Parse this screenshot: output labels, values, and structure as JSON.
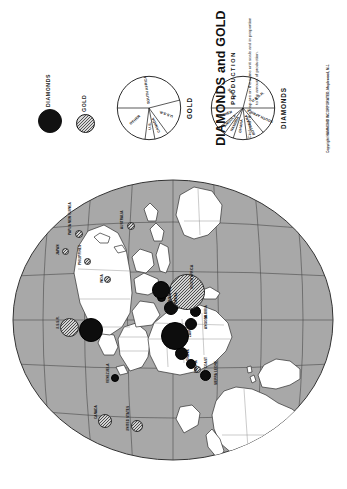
{
  "title": "DIAMONDS and  GOLD",
  "subtitle": "PRODUCTION",
  "caption": "Circles on the map are on the same unit scale and in proportion to the amount of production.",
  "copyright": "Copyright HAMMOND INCORPORATED, Maplewood, N.J.",
  "legend": {
    "diamonds_label": "DIAMONDS",
    "gold_label": "GOLD",
    "diamond_color": "#0d0d0d",
    "gold_color": "#d2d2d2"
  },
  "pies": [
    {
      "name": "GOLD",
      "caption": "GOLD",
      "slices": [
        {
          "label": "SOUTH AFRICA",
          "pct": 46
        },
        {
          "label": "U.S.S.R.",
          "pct": 19
        },
        {
          "label": "CANADA",
          "pct": 7
        },
        {
          "label": "U.S.",
          "pct": 5
        },
        {
          "label": "OTHER",
          "pct": 23
        }
      ]
    },
    {
      "name": "DIAMONDS",
      "caption": "DIAMONDS",
      "slices": [
        {
          "label": "ZAIRE",
          "pct": 29
        },
        {
          "label": "U.S.S.R.",
          "pct": 21
        },
        {
          "label": "SOUTH AFRICA",
          "pct": 14
        },
        {
          "label": "BOTSWANA",
          "pct": 9
        },
        {
          "label": "GHANA",
          "pct": 7
        },
        {
          "label": "NAMIBIA",
          "pct": 5
        },
        {
          "label": "ANGOLA",
          "pct": 4
        },
        {
          "label": "OTHER",
          "pct": 11
        }
      ]
    }
  ],
  "chart_data": {
    "type": "pie",
    "title": "DIAMONDS and GOLD PRODUCTION",
    "charts": [
      {
        "title": "GOLD",
        "categories": [
          "SOUTH AFRICA",
          "U.S.S.R.",
          "CANADA",
          "U.S.",
          "OTHER"
        ],
        "values": [
          46,
          19,
          7,
          5,
          23
        ],
        "units": "percent of world production"
      },
      {
        "title": "DIAMONDS",
        "categories": [
          "ZAIRE",
          "U.S.S.R.",
          "SOUTH AFRICA",
          "BOTSWANA",
          "GHANA",
          "NAMIBIA",
          "ANGOLA",
          "OTHER"
        ],
        "values": [
          29,
          21,
          14,
          9,
          7,
          5,
          4,
          11
        ],
        "units": "percent of world production"
      }
    ],
    "map_symbols": {
      "type": "proportional-circle",
      "legend": [
        "DIAMONDS",
        "GOLD"
      ]
    }
  },
  "map": {
    "labels": [
      {
        "text": "CANADA",
        "x": 60,
        "y": 86,
        "rot": 0
      },
      {
        "text": "UNITED STATES",
        "x": 48,
        "y": 118,
        "rot": 0
      },
      {
        "text": "VENEZUELA",
        "x": 96,
        "y": 98,
        "rot": 0
      },
      {
        "text": "U.S.S.R.",
        "x": 150,
        "y": 48,
        "rot": 0
      },
      {
        "text": "GHANA",
        "x": 118,
        "y": 178,
        "rot": 0
      },
      {
        "text": "LIBERIA",
        "x": 106,
        "y": 186,
        "rot": 0
      },
      {
        "text": "IVORY COAST",
        "x": 100,
        "y": 196,
        "rot": 0
      },
      {
        "text": "SIERRA LEONE",
        "x": 94,
        "y": 206,
        "rot": 0
      },
      {
        "text": "ZAIRE",
        "x": 142,
        "y": 180,
        "rot": 0
      },
      {
        "text": "ANGOLA",
        "x": 150,
        "y": 196,
        "rot": 0
      },
      {
        "text": "NAMIBIA",
        "x": 160,
        "y": 196,
        "rot": 0
      },
      {
        "text": "BOTSWANA",
        "x": 168,
        "y": 166,
        "rot": 0
      },
      {
        "text": "TANZANIA",
        "x": 176,
        "y": 160,
        "rot": 0
      },
      {
        "text": "SOUTH AFRICA",
        "x": 190,
        "y": 182,
        "rot": 0
      },
      {
        "text": "INDIA",
        "x": 196,
        "y": 92,
        "rot": 0
      },
      {
        "text": "PHILIPPINES",
        "x": 214,
        "y": 70,
        "rot": 0
      },
      {
        "text": "JAPAN",
        "x": 224,
        "y": 48,
        "rot": 0
      },
      {
        "text": "PAPUA NEW GUINEA",
        "x": 244,
        "y": 60,
        "rot": 0
      },
      {
        "text": "AUSTRALIA",
        "x": 250,
        "y": 112,
        "rot": 0
      }
    ],
    "circles": [
      {
        "place": "CANADA",
        "kind": "gold",
        "x": 57,
        "y": 96,
        "d": 12
      },
      {
        "place": "UNITED STATES",
        "kind": "gold",
        "x": 52,
        "y": 128,
        "d": 10
      },
      {
        "place": "VENEZUELA",
        "kind": "diamond",
        "x": 100,
        "y": 106,
        "d": 6
      },
      {
        "place": "U.S.S.R. GOLD",
        "kind": "gold",
        "x": 150,
        "y": 60,
        "d": 17
      },
      {
        "place": "U.S.S.R. DIAMONDS",
        "kind": "diamond",
        "x": 148,
        "y": 82,
        "d": 22
      },
      {
        "place": "GHANA",
        "kind": "diamond",
        "x": 124,
        "y": 172,
        "d": 11
      },
      {
        "place": "LIBERIA",
        "kind": "diamond",
        "x": 114,
        "y": 182,
        "d": 8
      },
      {
        "place": "IVORY COAST",
        "kind": "gold",
        "x": 108,
        "y": 188,
        "d": 5
      },
      {
        "place": "SIERRA LEONE",
        "kind": "diamond",
        "x": 102,
        "y": 196,
        "d": 9
      },
      {
        "place": "ZAIRE",
        "kind": "diamond",
        "x": 142,
        "y": 166,
        "d": 26
      },
      {
        "place": "ANGOLA",
        "kind": "diamond",
        "x": 154,
        "y": 182,
        "d": 10
      },
      {
        "place": "NAMIBIA",
        "kind": "diamond",
        "x": 166,
        "y": 186,
        "d": 9
      },
      {
        "place": "BOTSWANA",
        "kind": "diamond",
        "x": 170,
        "y": 162,
        "d": 12
      },
      {
        "place": "TANZANIA",
        "kind": "diamond",
        "x": 180,
        "y": 152,
        "d": 7
      },
      {
        "place": "SOUTH AFRICA GOLD",
        "kind": "gold",
        "x": 186,
        "y": 178,
        "d": 34
      },
      {
        "place": "SOUTH AFRICA DIAMONDS",
        "kind": "diamond",
        "x": 188,
        "y": 152,
        "d": 16
      },
      {
        "place": "INDIA",
        "kind": "gold",
        "x": 198,
        "y": 98,
        "d": 5
      },
      {
        "place": "PHILIPPINES",
        "kind": "gold",
        "x": 216,
        "y": 78,
        "d": 5
      },
      {
        "place": "JAPAN",
        "kind": "gold",
        "x": 226,
        "y": 56,
        "d": 5
      },
      {
        "place": "PAPUA NEW GUINEA",
        "kind": "gold",
        "x": 244,
        "y": 70,
        "d": 6
      },
      {
        "place": "AUSTRALIA",
        "kind": "gold",
        "x": 252,
        "y": 122,
        "d": 6
      }
    ]
  }
}
